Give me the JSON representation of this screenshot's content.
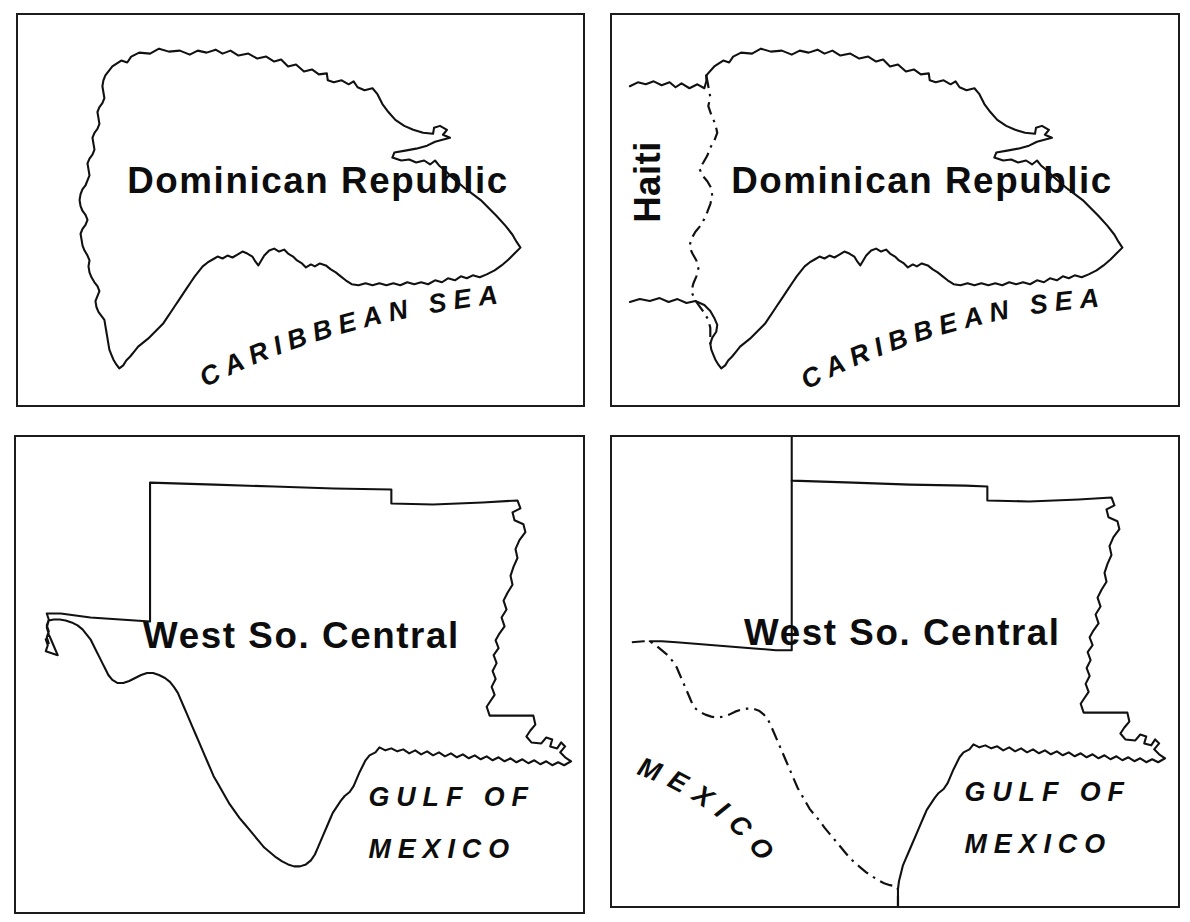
{
  "figure": {
    "layout": "2x2 grid of map panels",
    "background_color": "#ffffff",
    "ink_color": "#111111",
    "panel_border_color": "#1c1c1c"
  },
  "panels": [
    {
      "id": "dominican-republic-plain",
      "position": "top-left",
      "region_label": "Dominican Republic",
      "water_label": "CARIBBEAN SEA",
      "neighbor_label": "",
      "has_political_border": false,
      "has_neighbor_coastline": false
    },
    {
      "id": "dominican-republic-context",
      "position": "top-right",
      "region_label": "Dominican Republic",
      "water_label": "CARIBBEAN SEA",
      "neighbor_label": "Haiti",
      "has_political_border": true,
      "has_neighbor_coastline": true
    },
    {
      "id": "west-south-central-plain",
      "position": "bottom-left",
      "region_label": "West So. Central",
      "water_label_line1": "GULF OF",
      "water_label_line2": "MEXICO",
      "neighbor_label": "",
      "has_political_border": false,
      "has_neighbor_coastline": false
    },
    {
      "id": "west-south-central-context",
      "position": "bottom-right",
      "region_label": "West So. Central",
      "water_label_line1": "GULF OF",
      "water_label_line2": "MEXICO",
      "neighbor_label": "MEXICO",
      "has_political_border": true,
      "has_neighbor_coastline": true
    }
  ],
  "labels": {
    "dominican_republic": "Dominican Republic",
    "haiti": "Haiti",
    "caribbean_sea": "CARIBBEAN SEA",
    "west_so_central": "West So. Central",
    "gulf_of": "GULF OF",
    "mexico_water": "MEXICO",
    "mexico_country": "MEXICO"
  }
}
